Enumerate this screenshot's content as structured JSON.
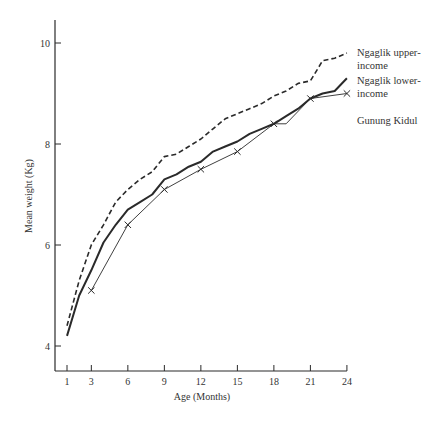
{
  "chart_data": {
    "type": "line",
    "title": "",
    "xlabel": "Age (Months)",
    "ylabel": "Mean weight (Kg)",
    "xlim": [
      0,
      25
    ],
    "ylim": [
      3.5,
      10.5
    ],
    "x_ticks": [
      1,
      3,
      6,
      9,
      12,
      15,
      18,
      21,
      24
    ],
    "y_ticks": [
      4,
      6,
      8,
      10
    ],
    "grid": false,
    "legend_position": "right, inline at line ends",
    "series": [
      {
        "name": "Ngaglik upper-income",
        "label_lines": [
          "Ngaglik upper-",
          "income"
        ],
        "style": "dashed",
        "x": [
          1,
          2,
          3,
          4,
          5,
          6,
          7,
          8,
          9,
          10,
          11,
          12,
          13,
          14,
          15,
          16,
          17,
          18,
          19,
          20,
          21,
          22,
          23,
          24
        ],
        "values": [
          4.4,
          5.3,
          6.0,
          6.4,
          6.85,
          7.1,
          7.3,
          7.45,
          7.75,
          7.8,
          7.95,
          8.1,
          8.3,
          8.5,
          8.6,
          8.7,
          8.8,
          8.95,
          9.05,
          9.2,
          9.25,
          9.65,
          9.7,
          9.8
        ]
      },
      {
        "name": "Ngaglik lower-income",
        "label_lines": [
          "Ngaglik lower-",
          "income"
        ],
        "style": "solid-thick",
        "x": [
          1,
          2,
          3,
          4,
          5,
          6,
          7,
          8,
          9,
          10,
          11,
          12,
          13,
          14,
          15,
          16,
          17,
          18,
          19,
          20,
          21,
          22,
          23,
          24
        ],
        "values": [
          4.2,
          5.0,
          5.5,
          6.05,
          6.4,
          6.7,
          6.85,
          7.0,
          7.3,
          7.4,
          7.55,
          7.65,
          7.85,
          7.95,
          8.05,
          8.2,
          8.3,
          8.4,
          8.55,
          8.7,
          8.9,
          9.0,
          9.05,
          9.3
        ]
      },
      {
        "name": "Gunung Kidul",
        "label_lines": [
          "Gunung Kidul"
        ],
        "style": "solid-thin-x-markers",
        "x": [
          3,
          6,
          9,
          12,
          15,
          18,
          19,
          21,
          24
        ],
        "values": [
          5.1,
          6.4,
          7.1,
          7.5,
          7.85,
          8.4,
          8.4,
          8.9,
          9.0
        ],
        "markers_at": [
          3,
          6,
          9,
          12,
          15,
          18,
          21,
          24
        ]
      }
    ]
  },
  "colors": {
    "ink": "#2a2a2a",
    "background": "#ffffff"
  }
}
